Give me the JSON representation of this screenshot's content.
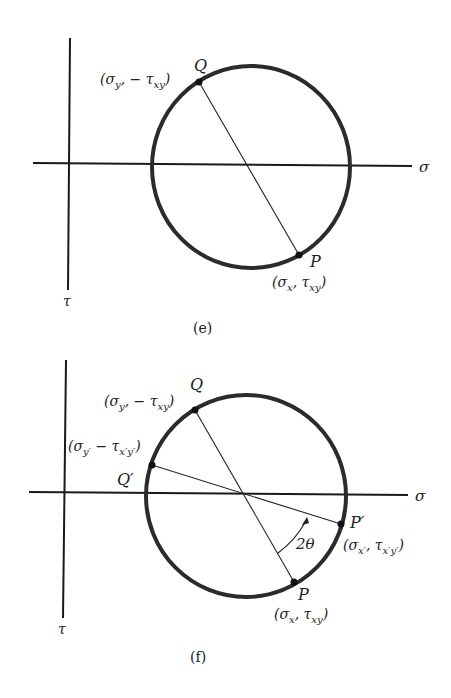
{
  "figures": [
    {
      "id": "e",
      "caption": "(e)",
      "axis_labels": {
        "horizontal": "σ",
        "vertical": "τ"
      },
      "points": [
        {
          "name": "Q",
          "coord_label": "(σy, − τxy)",
          "coord_main": "(σ",
          "coord_sub1": "y",
          "coord_mid": ", − τ",
          "coord_sub2": "xy",
          "coord_end": ")"
        },
        {
          "name": "P",
          "coord_label": "(σx, τxy)",
          "coord_main": "(σ",
          "coord_sub1": "x",
          "coord_mid": ", τ",
          "coord_sub2": "xy",
          "coord_end": ")"
        }
      ]
    },
    {
      "id": "f",
      "caption": "(f)",
      "axis_labels": {
        "horizontal": "σ",
        "vertical": "τ"
      },
      "angle_label": "2θ",
      "points": [
        {
          "name": "Q",
          "coord_label": "(σy, − τxy)",
          "coord_main": "(σ",
          "coord_sub1": "y",
          "coord_mid": ", − τ",
          "coord_sub2": "xy",
          "coord_end": ")"
        },
        {
          "name": "Q′",
          "coord_label": "(σy′ − τx′y′)",
          "coord_main": "(σ",
          "coord_sub1": "y′",
          "coord_mid": " − τ",
          "coord_sub2": "x′y′",
          "coord_end": ")"
        },
        {
          "name": "P′",
          "coord_label": "(σx′, τx′y′)",
          "coord_main": "(σ",
          "coord_sub1": "x′",
          "coord_mid": ", τ",
          "coord_sub2": "x′y′",
          "coord_end": ")"
        },
        {
          "name": "P",
          "coord_label": "(σx, τxy)",
          "coord_main": "(σ",
          "coord_sub1": "x",
          "coord_mid": ", τ",
          "coord_sub2": "xy",
          "coord_end": ")"
        }
      ]
    }
  ]
}
